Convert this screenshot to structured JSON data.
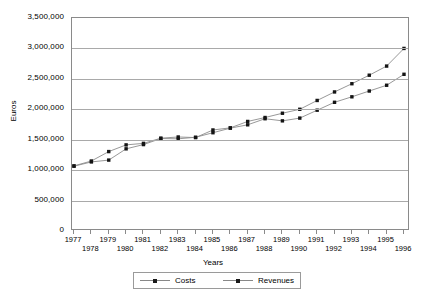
{
  "chart_data": {
    "type": "line",
    "title": "",
    "xlabel": "Years",
    "ylabel": "Euros",
    "ylim": [
      0,
      3500000
    ],
    "ytick_labels": [
      "3,500,000",
      "3,000,000",
      "2,500,000",
      "2,000,000",
      "1,500,000",
      "1,000,000",
      "500,000",
      "0"
    ],
    "ytick_values": [
      3500000,
      3000000,
      2500000,
      2000000,
      1500000,
      1000000,
      500000,
      0
    ],
    "grid": true,
    "legend_position": "bottom",
    "categories": [
      "1977",
      "1978",
      "1979",
      "1980",
      "1981",
      "1982",
      "1983",
      "1984",
      "1985",
      "1986",
      "1987",
      "1988",
      "1989",
      "1990",
      "1991",
      "1992",
      "1993",
      "1994",
      "1995",
      "1996"
    ],
    "series": [
      {
        "name": "Costs",
        "color": "#141414",
        "values": [
          1065000,
          1135000,
          1165000,
          1350000,
          1420000,
          1520000,
          1515000,
          1540000,
          1615000,
          1690000,
          1745000,
          1845000,
          1810000,
          1855000,
          1985000,
          2115000,
          2205000,
          2300000,
          2395000,
          2575000
        ]
      },
      {
        "name": "Revenues",
        "color": "#141414",
        "values": [
          1070000,
          1150000,
          1305000,
          1415000,
          1440000,
          1525000,
          1545000,
          1535000,
          1660000,
          1695000,
          1800000,
          1865000,
          1935000,
          2000000,
          2145000,
          2285000,
          2420000,
          2560000,
          2710000,
          3000000
        ]
      }
    ]
  },
  "legend": {
    "entries": [
      {
        "label": "Costs"
      },
      {
        "label": "Revenues"
      }
    ]
  }
}
